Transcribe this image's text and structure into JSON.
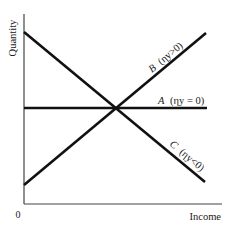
{
  "diagram": {
    "type": "line-diagram",
    "title": "",
    "y_axis_label": "Quantity",
    "x_axis_label": "Income",
    "origin_label": "0",
    "colors": {
      "line": "#111111",
      "axis": "#333333",
      "background": "#ffffff"
    },
    "lines": [
      {
        "id": "A",
        "letter": "A",
        "condition": "(ηy = 0)",
        "label": "A (ηy = 0)",
        "slope": "zero"
      },
      {
        "id": "B",
        "letter": "B",
        "condition": "(ηy>0)",
        "label": "B (ηy>0)",
        "slope": "positive"
      },
      {
        "id": "C",
        "letter": "C",
        "condition": "(ηy<0)",
        "label": "C (ηy<0)",
        "slope": "negative"
      }
    ]
  }
}
